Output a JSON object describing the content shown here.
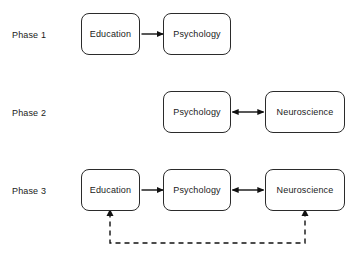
{
  "diagram": {
    "background_color": "#ffffff",
    "stroke_color": "#2b2b2b",
    "text_color": "#1a1a1a",
    "rows": [
      {
        "phase_label": "Phase 1",
        "nodes": [
          {
            "label": "Education",
            "x": 81,
            "y": 13,
            "w": 59,
            "h": 42
          },
          {
            "label": "Psychology",
            "x": 163,
            "y": 13,
            "w": 68,
            "h": 42
          }
        ]
      },
      {
        "phase_label": "Phase 2",
        "nodes": [
          {
            "label": "Psychology",
            "x": 163,
            "y": 91,
            "w": 68,
            "h": 42
          },
          {
            "label": "Neuroscience",
            "x": 265,
            "y": 91,
            "w": 80,
            "h": 42
          }
        ]
      },
      {
        "phase_label": "Phase 3",
        "nodes": [
          {
            "label": "Education",
            "x": 81,
            "y": 169,
            "w": 59,
            "h": 42
          },
          {
            "label": "Psychology",
            "x": 163,
            "y": 169,
            "w": 68,
            "h": 42
          },
          {
            "label": "Neuroscience",
            "x": 265,
            "y": 169,
            "w": 80,
            "h": 42
          }
        ]
      }
    ],
    "edges": [
      {
        "name": "psychology-to-education-phase1",
        "from": "Psychology",
        "to": "Education",
        "style": "solid",
        "direction": "single"
      },
      {
        "name": "psychology-neuroscience-phase2",
        "from": "Psychology",
        "to": "Neuroscience",
        "style": "solid",
        "direction": "double"
      },
      {
        "name": "psychology-to-education-phase3",
        "from": "Psychology",
        "to": "Education",
        "style": "solid",
        "direction": "single"
      },
      {
        "name": "psychology-neuroscience-phase3",
        "from": "Psychology",
        "to": "Neuroscience",
        "style": "solid",
        "direction": "double"
      },
      {
        "name": "neuroscience-to-education-feedback",
        "from": "Neuroscience",
        "to": "Education",
        "style": "dashed",
        "direction": "single"
      }
    ]
  }
}
